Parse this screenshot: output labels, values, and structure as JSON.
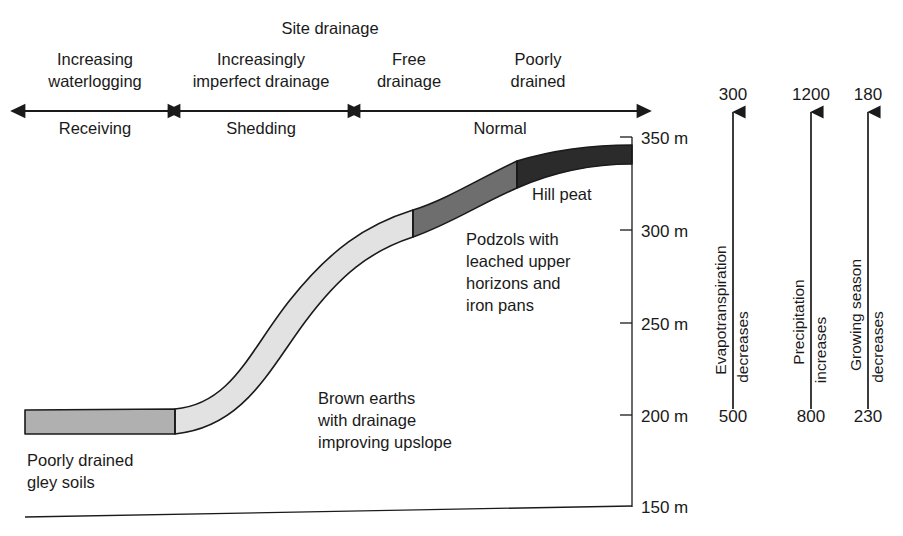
{
  "diagram": {
    "title": "Site drainage",
    "drainage_categories": [
      {
        "label_line1": "Increasing",
        "label_line2": "waterlogging"
      },
      {
        "label_line1": "Increasingly",
        "label_line2": "imperfect drainage"
      },
      {
        "label_line1": "Free",
        "label_line2": "drainage"
      },
      {
        "label_line1": "Poorly",
        "label_line2": "drained"
      }
    ],
    "flow_categories": [
      {
        "label": "Receiving"
      },
      {
        "label": "Shedding"
      },
      {
        "label": "Normal"
      }
    ],
    "soil_labels": [
      {
        "line1": "Poorly drained",
        "line2": "gley soils",
        "line3": "",
        "line4": ""
      },
      {
        "line1": "Brown earths",
        "line2": "with drainage",
        "line3": "improving upslope",
        "line4": ""
      },
      {
        "line1": "Podzols with",
        "line2": "leached upper",
        "line3": "horizons and",
        "line4": "iron pans"
      },
      {
        "line1": "Hill peat",
        "line2": "",
        "line3": "",
        "line4": ""
      }
    ],
    "soil_colors": {
      "gley": "#b0b0b0",
      "brown_earths": "#e2e2e2",
      "podzols": "#6e6e6e",
      "hill_peat": "#2b2b2b",
      "outline": "#1a1a1a"
    },
    "elevation_axis": {
      "unit": "m",
      "ticks": [
        {
          "label": "350 m"
        },
        {
          "label": "300 m"
        },
        {
          "label": "250 m"
        },
        {
          "label": "200 m"
        },
        {
          "label": "150 m"
        }
      ]
    },
    "climate_axes": [
      {
        "top_value": "300",
        "bottom_value": "500",
        "label_line1": "Evapotranspiration",
        "label_line2": "decreases"
      },
      {
        "top_value": "1200",
        "bottom_value": "800",
        "label_line1": "Precipitation",
        "label_line2": "increases"
      },
      {
        "top_value": "180",
        "bottom_value": "230",
        "label_line1": "Growing season",
        "label_line2": "decreases"
      }
    ]
  }
}
